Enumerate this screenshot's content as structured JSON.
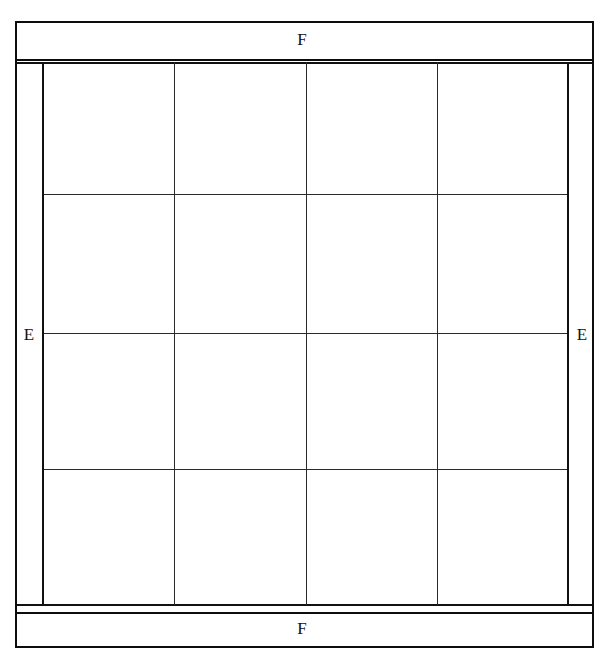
{
  "diagram": {
    "background_color": "#ffffff",
    "line_color": "#111111",
    "thin_line_color": "#2a2a2a",
    "labels": {
      "top_band": "F",
      "bottom_band": "F",
      "left_band": "E",
      "right_band": "E"
    },
    "bands": [
      {
        "id": "top-band",
        "label": "F",
        "orientation": "horizontal"
      },
      {
        "id": "bottom-band",
        "label": "F",
        "orientation": "horizontal"
      },
      {
        "id": "left-band",
        "label": "E",
        "orientation": "vertical"
      },
      {
        "id": "right-band",
        "label": "E",
        "orientation": "vertical"
      }
    ],
    "grid": {
      "columns": 4,
      "rows": 4,
      "column_edges_px": [
        42,
        174,
        306,
        437,
        568
      ],
      "row_edges_px": [
        62,
        195,
        334,
        470,
        605
      ],
      "cells": [
        {
          "row": 1,
          "col": 1,
          "value": ""
        },
        {
          "row": 1,
          "col": 2,
          "value": ""
        },
        {
          "row": 1,
          "col": 3,
          "value": ""
        },
        {
          "row": 1,
          "col": 4,
          "value": ""
        },
        {
          "row": 2,
          "col": 1,
          "value": ""
        },
        {
          "row": 2,
          "col": 2,
          "value": ""
        },
        {
          "row": 2,
          "col": 3,
          "value": ""
        },
        {
          "row": 2,
          "col": 4,
          "value": ""
        },
        {
          "row": 3,
          "col": 1,
          "value": ""
        },
        {
          "row": 3,
          "col": 2,
          "value": ""
        },
        {
          "row": 3,
          "col": 3,
          "value": ""
        },
        {
          "row": 3,
          "col": 4,
          "value": ""
        },
        {
          "row": 4,
          "col": 1,
          "value": ""
        },
        {
          "row": 4,
          "col": 2,
          "value": ""
        },
        {
          "row": 4,
          "col": 3,
          "value": ""
        },
        {
          "row": 4,
          "col": 4,
          "value": ""
        }
      ]
    },
    "outer_frame": {
      "left_px": 15,
      "right_px": 594,
      "top_px": 21,
      "bottom_px": 648
    }
  }
}
